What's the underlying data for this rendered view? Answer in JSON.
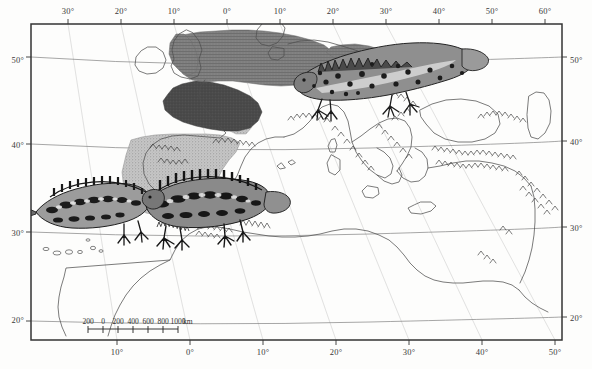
{
  "figure": {
    "kind": "distribution-map",
    "projection_note": "",
    "background_color": "#fdfdfc",
    "frame_color": "#333333"
  },
  "axes": {
    "top": {
      "name": "longitude-axis-top",
      "ticks": [
        {
          "label": "30°",
          "x": 68
        },
        {
          "label": "20°",
          "x": 121
        },
        {
          "label": "10°",
          "x": 174
        },
        {
          "label": "0°",
          "x": 227
        },
        {
          "label": "10°",
          "x": 280
        },
        {
          "label": "20°",
          "x": 333
        },
        {
          "label": "30°",
          "x": 386
        },
        {
          "label": "40°",
          "x": 439
        },
        {
          "label": "50°",
          "x": 492
        },
        {
          "label": "60°",
          "x": 545
        }
      ]
    },
    "bottom": {
      "name": "longitude-axis-bottom",
      "ticks": [
        {
          "label": "10°",
          "x": 117
        },
        {
          "label": "0°",
          "x": 190
        },
        {
          "label": "10°",
          "x": 263
        },
        {
          "label": "20°",
          "x": 336
        },
        {
          "label": "30°",
          "x": 409
        },
        {
          "label": "40°",
          "x": 482
        },
        {
          "label": "50°",
          "x": 555
        }
      ]
    },
    "left": {
      "name": "latitude-axis-left",
      "ticks": [
        {
          "label": "50°",
          "y": 60
        },
        {
          "label": "40°",
          "y": 145
        },
        {
          "label": "30°",
          "y": 233
        },
        {
          "label": "20°",
          "y": 320
        }
      ]
    },
    "right": {
      "name": "latitude-axis-right",
      "ticks": [
        {
          "label": "50°",
          "y": 60
        },
        {
          "label": "40°",
          "y": 142
        },
        {
          "label": "30°",
          "y": 228
        },
        {
          "label": "20°",
          "y": 318
        }
      ]
    }
  },
  "scalebar": {
    "name": "scale-bar",
    "ticks": [
      "200",
      "0",
      "200",
      "400",
      "600",
      "800",
      "1000"
    ],
    "unit": "km",
    "x_start": 88,
    "x_end": 178,
    "y": 325
  },
  "regions": [
    {
      "name": "iberian-range",
      "fill": "#b9b9b9",
      "pattern": "stipple-light",
      "description": "Iberian Peninsula shaded range"
    },
    {
      "name": "western-france-range",
      "fill": "#4a4a4a",
      "pattern": "solid-dark",
      "description": "Western France dark shaded range"
    },
    {
      "name": "northern-europe-range",
      "fill": "#7c7c7c",
      "pattern": "mid-gray",
      "description": "Britain, Low Countries, Germany, Denmark shaded range"
    }
  ],
  "illustrations": [
    {
      "name": "newt-illustration-top-right",
      "subject": "crested-newt",
      "x": 290,
      "y": 28,
      "width": 190,
      "height": 85
    },
    {
      "name": "newt-illustration-left",
      "subject": "marbled-newt-left",
      "x": 34,
      "y": 182,
      "width": 130,
      "height": 62
    },
    {
      "name": "newt-illustration-center",
      "subject": "marbled-newt-center",
      "x": 140,
      "y": 178,
      "width": 150,
      "height": 70
    }
  ],
  "colors": {
    "coastline": "#555555",
    "graticule": "#666666",
    "shading_light": "#bdbdbd",
    "shading_mid": "#7d7d7d",
    "shading_dark": "#454545",
    "mountain_hatch": "#2b2b2b"
  }
}
